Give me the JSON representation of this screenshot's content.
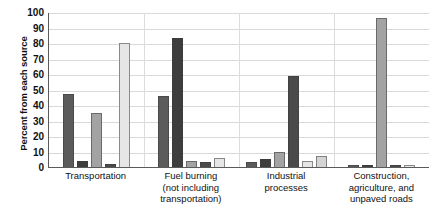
{
  "chart_data": {
    "type": "bar",
    "title": "",
    "xlabel": "",
    "ylabel": "Percent from each source",
    "ylim": [
      0,
      100
    ],
    "ytick_labels": [
      "100",
      "90",
      "80",
      "70",
      "60",
      "50",
      "40",
      "30",
      "20",
      "10",
      "0"
    ],
    "ytick_values": [
      100,
      90,
      80,
      70,
      60,
      50,
      40,
      30,
      20,
      10,
      0
    ],
    "grid": true,
    "legend": "none",
    "categories": [
      "Transportation",
      "Fuel burning (not including transportation)",
      "Industrial processes",
      "Construction, agriculture, and unpaved roads"
    ],
    "category_lines": [
      [
        "Transportation"
      ],
      [
        "Fuel burning",
        "(not including",
        "transportation)"
      ],
      [
        "Industrial",
        "processes"
      ],
      [
        "Construction,",
        "agriculture, and",
        "unpaved roads"
      ]
    ],
    "series": [
      {
        "name": "series-1",
        "color": "#5b5b5b",
        "values": [
          47,
          46,
          3,
          1
        ]
      },
      {
        "name": "series-2",
        "color": "#3d3d3d",
        "values": [
          4,
          83,
          5,
          1
        ]
      },
      {
        "name": "series-3",
        "color": "#a3a3a3",
        "values": [
          35,
          4,
          10,
          96
        ]
      },
      {
        "name": "series-4",
        "color": "#4a4a4a",
        "values": [
          2,
          3,
          59,
          1
        ]
      },
      {
        "name": "series-5",
        "color": "#e6e6e6",
        "values": [
          80,
          6,
          4,
          1
        ]
      },
      {
        "name": "series-6",
        "color": "#d4d4d4",
        "values": [
          0,
          0,
          7,
          0
        ]
      }
    ],
    "colors": {
      "dark": "#5b5b5b",
      "near_black": "#3d3d3d",
      "medium": "#a3a3a3",
      "light": "#e6e6e6",
      "axis": "#5a5a5a",
      "grid": "#d9d9d9"
    }
  }
}
